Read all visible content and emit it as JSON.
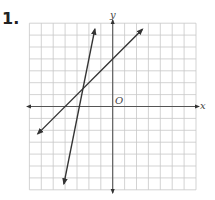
{
  "problem": {
    "number_label": "1."
  },
  "graph": {
    "x_axis_label": "x",
    "y_axis_label": "y",
    "origin_label": "O",
    "grid": {
      "x_range": [
        -7,
        7
      ],
      "y_range": [
        -7,
        7
      ],
      "step": 1
    },
    "colors": {
      "grid": "#c8c8c8",
      "axis": "#555555",
      "line": "#333333"
    }
  },
  "chart_data": {
    "type": "line",
    "title": "1.",
    "xlabel": "x",
    "ylabel": "y",
    "xlim": [
      -7,
      7
    ],
    "ylim": [
      -7,
      7
    ],
    "grid": true,
    "axis_ticks_labeled": false,
    "annotations": [
      "O (origin)"
    ],
    "series": [
      {
        "name": "line-a (shallow)",
        "equation": "y = x + 4",
        "slope": 1,
        "y_intercept": 4,
        "x": [
          -6.3,
          2.5
        ],
        "y": [
          -2.3,
          6.5
        ],
        "arrows": "both"
      },
      {
        "name": "line-b (steep)",
        "equation": "y = 5x + 14",
        "slope": 5,
        "y_intercept": 14,
        "x": [
          -4.1,
          -1.5
        ],
        "y": [
          -6.5,
          6.5
        ],
        "arrows": "both"
      }
    ],
    "intersection": {
      "x": -2.5,
      "y": 1.5
    }
  }
}
